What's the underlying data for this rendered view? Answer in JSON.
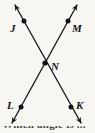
{
  "figure": {
    "type": "geometry-diagram",
    "background_color": "#f7f6f3",
    "stroke_color": "#1a1a1e",
    "width": 95,
    "height": 133,
    "points": [
      {
        "name": "J",
        "label": "J",
        "x": 24,
        "y": 21,
        "label_x": 10,
        "label_y": 23
      },
      {
        "name": "M",
        "label": "M",
        "x": 68,
        "y": 21,
        "label_x": 72,
        "label_y": 23
      },
      {
        "name": "N",
        "label": "N",
        "x": 45,
        "y": 63,
        "label_x": 51,
        "label_y": 61
      },
      {
        "name": "L",
        "label": "L",
        "x": 21,
        "y": 107,
        "label_x": 7,
        "label_y": 100
      },
      {
        "name": "K",
        "label": "K",
        "x": 71,
        "y": 107,
        "label_x": 76,
        "label_y": 100
      }
    ],
    "lines": [
      {
        "name": "line-JK",
        "through": [
          "J",
          "N",
          "K"
        ],
        "x1": 15,
        "y1": 5,
        "x2": 81,
        "y2": 123,
        "arrow_start": true,
        "arrow_end": true
      },
      {
        "name": "line-MLX",
        "through": [
          "M",
          "N",
          "L"
        ],
        "x1": 77,
        "y1": 5,
        "x2": 12,
        "y2": 123,
        "arrow_start": true,
        "arrow_end": true
      }
    ]
  },
  "bottom_text": {
    "cut_off_caption": "Which angle is ..."
  }
}
